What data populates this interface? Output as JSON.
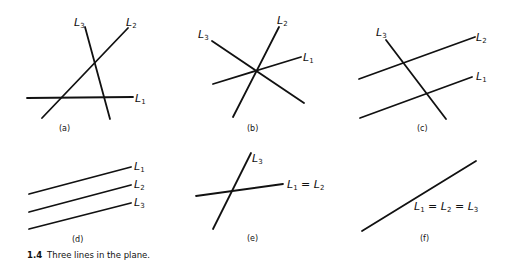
{
  "figure": {
    "number": "1.4",
    "caption": "Three lines in the plane."
  },
  "panels": [
    {
      "id": "a",
      "label": "(a)",
      "description": "Three lines intersecting pairwise at three distinct points",
      "lines": [
        {
          "name": "L1",
          "x1": 27,
          "y1": 98,
          "x2": 133,
          "y2": 97
        },
        {
          "name": "L2",
          "x1": 42,
          "y1": 118,
          "x2": 128,
          "y2": 28
        },
        {
          "name": "L3",
          "x1": 85,
          "y1": 27,
          "x2": 110,
          "y2": 119
        }
      ],
      "labels": [
        {
          "text": "L",
          "sub": "3",
          "x": 74,
          "y": 26
        },
        {
          "text": "L",
          "sub": "2",
          "x": 126,
          "y": 26
        },
        {
          "text": "L",
          "sub": "1",
          "x": 135,
          "y": 102
        }
      ]
    },
    {
      "id": "b",
      "label": "(b)",
      "description": "Three lines meeting at one common point",
      "lines": [
        {
          "name": "L1",
          "x1": 213,
          "y1": 84,
          "x2": 301,
          "y2": 57
        },
        {
          "name": "L2",
          "x1": 233,
          "y1": 117,
          "x2": 279,
          "y2": 27
        },
        {
          "name": "L3",
          "x1": 212,
          "y1": 41,
          "x2": 304,
          "y2": 103
        }
      ],
      "labels": [
        {
          "text": "L",
          "sub": "2",
          "x": 277,
          "y": 24
        },
        {
          "text": "L",
          "sub": "3",
          "x": 198,
          "y": 38
        },
        {
          "text": "L",
          "sub": "1",
          "x": 303,
          "y": 61
        }
      ]
    },
    {
      "id": "c",
      "label": "(c)",
      "description": "L1 parallel to L2, both crossed by L3",
      "lines": [
        {
          "name": "L2",
          "x1": 359,
          "y1": 79,
          "x2": 475,
          "y2": 37
        },
        {
          "name": "L1",
          "x1": 360,
          "y1": 118,
          "x2": 472,
          "y2": 77
        },
        {
          "name": "L3",
          "x1": 386,
          "y1": 40,
          "x2": 446,
          "y2": 119
        }
      ],
      "labels": [
        {
          "text": "L",
          "sub": "3",
          "x": 376,
          "y": 36
        },
        {
          "text": "L",
          "sub": "2",
          "x": 476,
          "y": 41
        },
        {
          "text": "L",
          "sub": "1",
          "x": 476,
          "y": 80
        }
      ]
    },
    {
      "id": "d",
      "label": "(d)",
      "description": "Three parallel lines",
      "lines": [
        {
          "name": "L1",
          "x1": 29,
          "y1": 194,
          "x2": 131,
          "y2": 167
        },
        {
          "name": "L2",
          "x1": 29,
          "y1": 212,
          "x2": 131,
          "y2": 185
        },
        {
          "name": "L3",
          "x1": 29,
          "y1": 229,
          "x2": 131,
          "y2": 203
        }
      ],
      "labels": [
        {
          "text": "L",
          "sub": "1",
          "x": 134,
          "y": 169
        },
        {
          "text": "L",
          "sub": "2",
          "x": 134,
          "y": 187
        },
        {
          "text": "L",
          "sub": "3",
          "x": 134,
          "y": 205
        }
      ]
    },
    {
      "id": "e",
      "label": "(e)",
      "description": "L1 and L2 coincide, crossed by L3",
      "lines": [
        {
          "name": "L3",
          "x1": 213,
          "y1": 229,
          "x2": 251,
          "y2": 153
        },
        {
          "name": "L1 = L2",
          "x1": 196,
          "y1": 196,
          "x2": 283,
          "y2": 184
        }
      ],
      "labels": [
        {
          "text": "L",
          "sub": "3",
          "x": 252,
          "y": 162
        },
        {
          "text": "L",
          "sub": "1",
          "x": 287,
          "y": 187,
          "suffix": " = L",
          "sub2": "2"
        }
      ]
    },
    {
      "id": "f",
      "label": "(f)",
      "description": "All three lines coincide",
      "lines": [
        {
          "name": "L1 = L2 = L3",
          "x1": 362,
          "y1": 231,
          "x2": 476,
          "y2": 161
        }
      ],
      "labels": [
        {
          "text": "L1 = L2 = L3",
          "x": 414,
          "y": 210
        }
      ]
    }
  ],
  "panel_labels": {
    "a": "(a)",
    "b": "(b)",
    "c": "(c)",
    "d": "(d)",
    "e": "(e)",
    "f": "(f)"
  },
  "label_text": {
    "L": "L",
    "s1": "1",
    "s2": "2",
    "s3": "3",
    "eq": " = "
  }
}
